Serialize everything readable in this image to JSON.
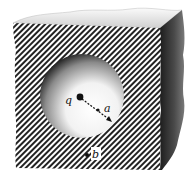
{
  "figure": {
    "labels": {
      "charge": "q",
      "radius": "a",
      "point": "b"
    },
    "colors": {
      "background": "#ffffff",
      "ink": "#111111",
      "side_face": "#3a3a3a",
      "top_face": "#e8e8e8"
    }
  }
}
